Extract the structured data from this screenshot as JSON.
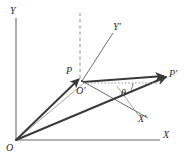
{
  "figure": {
    "kind": "vector-rotation-diagram",
    "background_color": "#ffffff",
    "stroke_color": "#3a3a3a",
    "label_color": "#2b2b2b",
    "width": 185,
    "height": 160
  },
  "axes": {
    "y_label": "Y",
    "x_label": "X",
    "y_prime_label": "Y'",
    "x_prime_label": "X'"
  },
  "points": {
    "origin_label": "O",
    "origin_prime_label": "O'",
    "p_label": "P",
    "p_prime_label": "P'"
  },
  "annotations": {
    "angle_label": "θ"
  },
  "geometry": {
    "origin": [
      16,
      140
    ],
    "y_axis_top": [
      16,
      18
    ],
    "x_axis_right": [
      160,
      140
    ],
    "o_prime": [
      82,
      81
    ],
    "p": [
      79,
      79
    ],
    "p_prime": [
      166,
      77
    ],
    "y_prime_end": [
      113,
      33
    ],
    "x_prime_end": [
      148,
      118
    ],
    "dashed_top": [
      80,
      13
    ],
    "dashed_bottom": [
      80,
      80
    ]
  }
}
